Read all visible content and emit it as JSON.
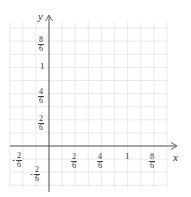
{
  "diagram": {
    "type": "coordinate-grid",
    "axes": {
      "x_label": "x",
      "y_label": "y"
    },
    "grid_unit": "1/6",
    "x_ticks": [
      {
        "sign": "-",
        "num": "2",
        "den": "6",
        "value": -0.3333
      },
      {
        "sign": "",
        "num": "2",
        "den": "6",
        "value": 0.3333
      },
      {
        "sign": "",
        "num": "4",
        "den": "6",
        "value": 0.6667
      },
      {
        "sign": "",
        "whole": "1",
        "value": 1
      },
      {
        "sign": "",
        "num": "8",
        "den": "6",
        "value": 1.3333
      }
    ],
    "y_ticks": [
      {
        "sign": "",
        "num": "8",
        "den": "6",
        "value": 1.3333
      },
      {
        "sign": "",
        "whole": "1",
        "value": 1
      },
      {
        "sign": "",
        "num": "4",
        "den": "6",
        "value": 0.6667
      },
      {
        "sign": "",
        "num": "2",
        "den": "6",
        "value": 0.3333
      },
      {
        "sign": "-",
        "num": "2",
        "den": "6",
        "value": -0.3333
      }
    ],
    "colors": {
      "grid": "#e2e2e2",
      "axis": "#555555",
      "text": "#333333"
    }
  }
}
